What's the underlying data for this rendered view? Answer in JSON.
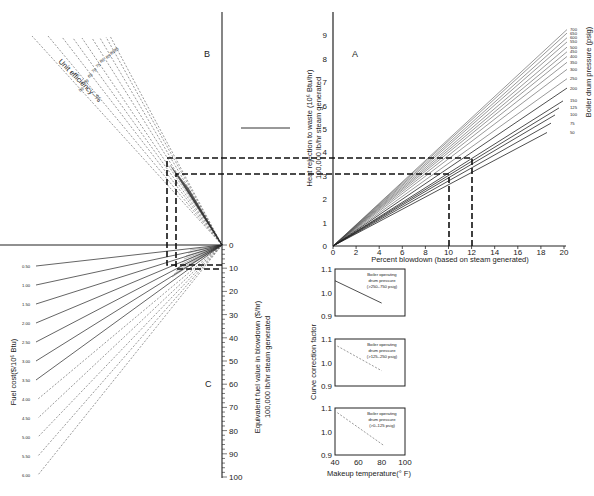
{
  "panels": {
    "A": "A",
    "B": "B",
    "C": "C"
  },
  "chart_data": [
    {
      "id": "A",
      "type": "line",
      "title": "",
      "xlabel": "Percent blowdown (based on steam generated)",
      "ylabel_line1": "Heat rejection to waste (10⁶ Btu/hr)",
      "ylabel_line2": "100,000 lb/hr steam generated",
      "series_label": "Boiler drum pressure (psig)",
      "x_ticks": [
        0,
        2,
        4,
        6,
        8,
        10,
        12,
        14,
        16,
        18,
        20
      ],
      "y_ticks": [
        0,
        1,
        2,
        3,
        4,
        5,
        6,
        7,
        8,
        9
      ],
      "xlim": [
        0,
        20
      ],
      "ylim": [
        0,
        10
      ],
      "grid": false,
      "series": [
        {
          "name": "700",
          "end_y": 9.25
        },
        {
          "name": "650",
          "end_y": 9.1
        },
        {
          "name": "600",
          "end_y": 8.9
        },
        {
          "name": "550",
          "end_y": 8.72
        },
        {
          "name": "500",
          "end_y": 8.5
        },
        {
          "name": "450",
          "end_y": 8.3
        },
        {
          "name": "400",
          "end_y": 8.1
        },
        {
          "name": "350",
          "end_y": 7.85
        },
        {
          "name": "300",
          "end_y": 7.55
        },
        {
          "name": "250",
          "end_y": 7.15
        },
        {
          "name": "200",
          "end_y": 6.75
        },
        {
          "name": "150",
          "end_y": 6.2
        },
        {
          "name": "125",
          "end_y": 5.9
        },
        {
          "name": "100",
          "end_y": 5.6
        },
        {
          "name": "75",
          "end_y": 5.25
        },
        {
          "name": "50",
          "end_y": 4.85
        }
      ],
      "examples": [
        {
          "x": 10,
          "y": 3.1
        },
        {
          "x": 12,
          "y": 3.7
        }
      ]
    },
    {
      "id": "B",
      "type": "line",
      "title": "",
      "series_label": "Unit efficiency–%",
      "series": [
        {
          "name": "50"
        },
        {
          "name": "60"
        },
        {
          "name": "65"
        },
        {
          "name": "70"
        },
        {
          "name": "75"
        },
        {
          "name": "80"
        },
        {
          "name": "85"
        },
        {
          "name": "90"
        },
        {
          "name": "95"
        }
      ]
    },
    {
      "id": "C",
      "type": "line",
      "title": "",
      "ylabel_line1": "Equivalent fuel value in blowdown ($/hr)",
      "ylabel_line2": "100,000 lb/hr steam generated",
      "series_label": "Fuel cost($/10⁶ Btu)",
      "y_ticks": [
        0,
        10,
        20,
        30,
        40,
        50,
        60,
        70,
        80,
        90,
        100
      ],
      "ylim": [
        0,
        100
      ],
      "series": [
        {
          "name": "0.50"
        },
        {
          "name": "1.00"
        },
        {
          "name": "1.50"
        },
        {
          "name": "2.00"
        },
        {
          "name": "2.50"
        },
        {
          "name": "3.00"
        },
        {
          "name": "3.50"
        },
        {
          "name": "4.00"
        },
        {
          "name": "4.50"
        },
        {
          "name": "5.00"
        },
        {
          "name": "5.50"
        },
        {
          "name": "6.00"
        }
      ]
    },
    {
      "id": "correction",
      "type": "line",
      "ylabel": "Curve correction factor",
      "xlabel": "Makeup temperature(° F)",
      "x_ticks": [
        40,
        60,
        80,
        100
      ],
      "y_ticks": [
        0.9,
        1.0,
        1.1
      ],
      "xlim": [
        40,
        100
      ],
      "ylim": [
        0.9,
        1.1
      ],
      "subplots": [
        {
          "label_line1": "Boiler operating",
          "label_line2": "drum pressure",
          "label_line3": "(>250–750 psig)",
          "line": [
            [
              40,
              1.05
            ],
            [
              80,
              0.955
            ]
          ]
        },
        {
          "label_line1": "Boiler operating",
          "label_line2": "drum pressure",
          "label_line3": "(>125–250 psig)",
          "line": [
            [
              42,
              1.07
            ],
            [
              80,
              0.965
            ]
          ]
        },
        {
          "label_line1": "Boiler operating",
          "label_line2": "drum pressure",
          "label_line3": "(>0–125 psig)",
          "line": [
            [
              42,
              1.08
            ],
            [
              82,
              0.94
            ]
          ]
        }
      ]
    }
  ]
}
